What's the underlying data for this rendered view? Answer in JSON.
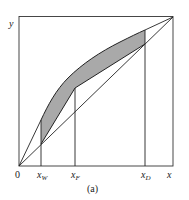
{
  "figure": {
    "caption": "(a)",
    "axis_labels": {
      "y": "y",
      "x": "x",
      "origin": "0"
    },
    "tick_labels": [
      {
        "base": "x",
        "sub": "W",
        "name": "x-w-label"
      },
      {
        "base": "x",
        "sub": "F",
        "name": "x-f-label"
      },
      {
        "base": "x",
        "sub": "D",
        "name": "x-d-label"
      }
    ],
    "colors": {
      "line": "#222222",
      "shade": "#a9a9a9",
      "frame": "#333333"
    }
  },
  "diagram_data": {
    "type": "McCabe-Thiele style equilibrium diagram",
    "frame": {
      "x0": 0,
      "y0": 0,
      "x1": 1,
      "y1": 1
    },
    "elements": [
      "diagonal line y = x from origin to (1,1)",
      "equilibrium curve from x_W to x_D (concave)",
      "line from origin to equilibrium curve at x_W",
      "line from (1,1) to equilibrium curve at x_D",
      "operating lines from diagonal at x_W to kink at x_F to diagonal at x_D",
      "shaded region between equilibrium curve and operating lines",
      "vertical lines at x_W, x_F, x_D"
    ],
    "approx_positions": {
      "x_W": 0.14,
      "x_F": 0.36,
      "x_D": 0.82
    }
  }
}
